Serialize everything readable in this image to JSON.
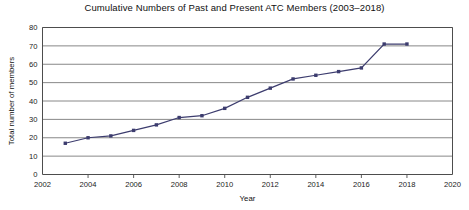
{
  "chart_data": {
    "type": "line",
    "title": "Cumulative Numbers of Past and Present ATC Members (2003–2018)",
    "xlabel": "Year",
    "ylabel": "Total number of members",
    "x": [
      2003,
      2004,
      2005,
      2006,
      2007,
      2008,
      2009,
      2010,
      2011,
      2012,
      2013,
      2014,
      2015,
      2016,
      2017,
      2018
    ],
    "values": [
      17,
      20,
      21,
      24,
      27,
      31,
      32,
      36,
      42,
      47,
      52,
      54,
      56,
      58,
      71,
      71
    ],
    "series": [
      {
        "name": "Cumulative members",
        "values": [
          17,
          20,
          21,
          24,
          27,
          31,
          32,
          36,
          42,
          47,
          52,
          54,
          56,
          58,
          71,
          71
        ]
      }
    ],
    "xlim": [
      2002,
      2020
    ],
    "ylim": [
      0,
      80
    ],
    "xticks": [
      2002,
      2004,
      2006,
      2008,
      2010,
      2012,
      2014,
      2016,
      2018,
      2020
    ],
    "xtick_labels": [
      "2002",
      "2004",
      "2006",
      "2008",
      "2010",
      "2012",
      "2014",
      "2016",
      "2018",
      "2020"
    ],
    "yticks": [
      0,
      10,
      20,
      30,
      40,
      50,
      60,
      70,
      80
    ],
    "ytick_labels": [
      "0",
      "10",
      "20",
      "30",
      "40",
      "50",
      "60",
      "70",
      "80"
    ],
    "grid": "horizontal",
    "legend": "none",
    "marker": "square",
    "line_color": "#3c3c6e",
    "marker_color": "#3c3c6e",
    "grid_color": "#7a7a7a",
    "axis_color": "#4d4d4d",
    "background": "#ffffff"
  }
}
